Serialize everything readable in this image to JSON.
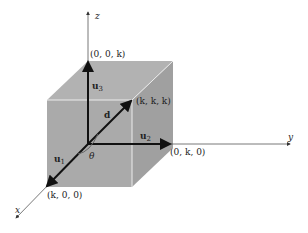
{
  "diagram": {
    "type": "3d-cube-vectors",
    "colors": {
      "cube_fill": "#a8a8a8",
      "cube_top": "#b4b4b4",
      "cube_side": "#9c9c9c",
      "edge": "#e8e8e8",
      "axis": "#555555",
      "vector": "#111111"
    },
    "axes": {
      "x": "x",
      "y": "y",
      "z": "z"
    },
    "points": {
      "z_point": "(0, 0, k)",
      "diag_point": "(k, k, k)",
      "y_point": "(0, k, 0)",
      "x_point": "(k, 0, 0)"
    },
    "vectors": {
      "u1": {
        "bold": "u",
        "sub": "1"
      },
      "u2": {
        "bold": "u",
        "sub": "2"
      },
      "u3": {
        "bold": "u",
        "sub": "3"
      },
      "d": "d"
    },
    "angle": "θ"
  }
}
